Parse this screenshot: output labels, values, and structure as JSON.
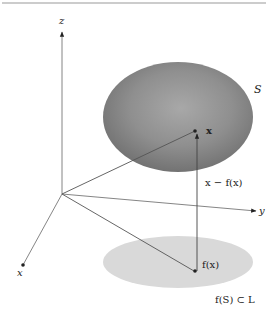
{
  "diagram": {
    "type": "3d-projection-illustration",
    "axes": {
      "z_label": "z",
      "y_label": "y",
      "x_label": "x"
    },
    "surface": {
      "label": "S",
      "fill_color": "#8c8c8c"
    },
    "subspace": {
      "label": "f(S) ⊂ L",
      "fill_color": "#d9d9d9"
    },
    "point": {
      "label": "x"
    },
    "projection": {
      "label": "f(x)"
    },
    "residual": {
      "label": "x − f(x)"
    },
    "colors": {
      "line": "#555555",
      "top_rule": "#999999"
    }
  }
}
